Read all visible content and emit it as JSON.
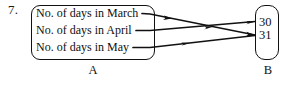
{
  "question": {
    "number": "7."
  },
  "set_a": {
    "label": "A",
    "elements": [
      {
        "text": "No. of days in March"
      },
      {
        "text": "No. of days in April"
      },
      {
        "text": "No. of days in May"
      }
    ]
  },
  "set_b": {
    "label": "B",
    "elements": [
      {
        "text": "30"
      },
      {
        "text": "31"
      }
    ]
  },
  "mapping": {
    "arrows": [
      {
        "from": "No. of days in March",
        "to": "31"
      },
      {
        "from": "No. of days in April",
        "to": "30"
      },
      {
        "from": "No. of days in May",
        "to": "31"
      }
    ]
  },
  "colors": {
    "ink": "#111111",
    "background": "#ffffff"
  }
}
